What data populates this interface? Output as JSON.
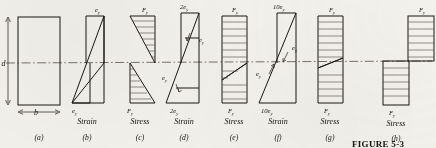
{
  "figure": {
    "caption": "FIGURE 5-3",
    "neutral_axis_style": "dash-dot",
    "ink_color": "#1a1814",
    "paper_color": "#f3f1ec",
    "hatch_color": "#5a554d"
  },
  "section_dims": {
    "depth_label": "d",
    "width_label": "b"
  },
  "panels": [
    {
      "key": "a",
      "letter": "(a)",
      "kind": "cross-section",
      "top_label": "",
      "bottom_label": "",
      "caption_line1": "",
      "caption_line2": ""
    },
    {
      "key": "b",
      "letter": "(b)",
      "kind": "strain",
      "top_label": "e",
      "top_sub": "y",
      "bottom_label": "e",
      "bottom_sub": "y",
      "caption_line1": "ey",
      "caption_line2": "Strain"
    },
    {
      "key": "c",
      "letter": "(c)",
      "kind": "stress",
      "top_label": "F",
      "top_sub": "y",
      "bottom_label": "F",
      "bottom_sub": "y",
      "caption_line1": "Fy",
      "caption_line2": "Stress"
    },
    {
      "key": "d",
      "letter": "(d)",
      "kind": "strain",
      "top_label": "2e",
      "top_sub": "y",
      "bottom_label": "2e",
      "bottom_sub": "y",
      "inner_label": "e",
      "inner_sub": "y",
      "caption_line1": "2ey",
      "caption_line2": "Strain"
    },
    {
      "key": "e",
      "letter": "(e)",
      "kind": "stress",
      "top_label": "F",
      "top_sub": "y",
      "bottom_label": "F",
      "bottom_sub": "y",
      "caption_line1": "Fy",
      "caption_line2": "Stress"
    },
    {
      "key": "f",
      "letter": "(f)",
      "kind": "strain",
      "top_label": "10e",
      "top_sub": "y",
      "bottom_label": "10e",
      "bottom_sub": "y",
      "inner_label": "e",
      "inner_sub": "y",
      "caption_line1": "10ey",
      "caption_line2": "Strain"
    },
    {
      "key": "g",
      "letter": "(g)",
      "kind": "stress",
      "top_label": "F",
      "top_sub": "y",
      "bottom_label": "F",
      "bottom_sub": "y",
      "caption_line1": "Fy",
      "caption_line2": "Stress"
    },
    {
      "key": "h",
      "letter": "(h)",
      "kind": "stress",
      "top_label": "F",
      "top_sub": "y",
      "bottom_label": "F",
      "bottom_sub": "y",
      "caption_line1": "Fy",
      "caption_line2": "Stress"
    }
  ],
  "captions": {
    "strain_word": "Strain",
    "stress_word": "Stress",
    "epsilon": "e",
    "sub_y": "y",
    "two_epsilon": "2e",
    "ten_epsilon": "10e",
    "fy": "F"
  }
}
